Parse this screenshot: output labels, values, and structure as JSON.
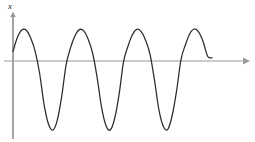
{
  "figure": {
    "background_color": "#ffffff",
    "axis_color": "#9a9a9a",
    "curve_color": "#2b2b2b",
    "y_axis_label": "x",
    "x_axis_label": ""
  },
  "axes": {
    "origin_x_px": 13,
    "baseline_y_px": 61,
    "x_axis_start_px": 4,
    "x_axis_end_px": 249,
    "y_axis_top_px": 14,
    "y_axis_bottom_px": 139,
    "x_arrow": true,
    "y_arrow": true,
    "ticks": [],
    "gridlines": false
  },
  "chart_data": {
    "type": "line",
    "title": "",
    "subtitle": "",
    "xlabel": "",
    "ylabel": "x",
    "xlim": [
      0,
      4.6
    ],
    "ylim": [
      -1.15,
      1.15
    ],
    "grid": false,
    "legend": null,
    "axis_labels": {
      "y_axis_tip_label": "x"
    },
    "wave": {
      "amplitude": 1.0,
      "cycles_shown": 4,
      "period_px": 56.5,
      "phase_start_value": 0.44,
      "peak_y_px": 29,
      "trough_y_px": 130,
      "curve_start_px": [
        13,
        46
      ],
      "curve_end_px": [
        212,
        31
      ]
    },
    "peaks_px": [
      {
        "x": 27,
        "y": 29
      },
      {
        "x": 84,
        "y": 29
      },
      {
        "x": 141,
        "y": 29
      },
      {
        "x": 198,
        "y": 29
      }
    ],
    "troughs_px": [
      {
        "x": 55,
        "y": 130
      },
      {
        "x": 112,
        "y": 130
      },
      {
        "x": 169,
        "y": 130
      }
    ],
    "zero_crossings_px": [
      41,
      69,
      98,
      126,
      155,
      183
    ],
    "series": [
      {
        "name": "displacement",
        "x": [
          0.0,
          0.1,
          0.2,
          0.3,
          0.4,
          0.5,
          0.6,
          0.7,
          0.8,
          0.9,
          1.0,
          1.1,
          1.2,
          1.3,
          1.4,
          1.5,
          1.6,
          1.7,
          1.8,
          1.9,
          2.0,
          2.1,
          2.2,
          2.3,
          2.4,
          2.5,
          2.6,
          2.7,
          2.8,
          2.9,
          3.0,
          3.1,
          3.2,
          3.3,
          3.4,
          3.5,
          3.6,
          3.7,
          3.8,
          3.9,
          4.0,
          4.1,
          4.2,
          4.3,
          4.4,
          4.5
        ],
        "y": [
          0.3,
          0.74,
          0.97,
          0.96,
          0.72,
          0.31,
          -0.17,
          -0.62,
          -0.91,
          -1.0,
          -0.86,
          -0.52,
          -0.06,
          0.41,
          0.78,
          0.98,
          0.94,
          0.68,
          0.25,
          -0.23,
          -0.66,
          -0.93,
          -1.0,
          -0.83,
          -0.48,
          -0.01,
          0.46,
          0.82,
          0.99,
          0.92,
          0.64,
          0.2,
          -0.28,
          -0.71,
          -0.95,
          -0.99,
          -0.79,
          -0.43,
          0.05,
          0.51,
          0.86,
          1.0,
          0.9,
          0.6,
          0.15,
          0.1
        ]
      }
    ]
  }
}
